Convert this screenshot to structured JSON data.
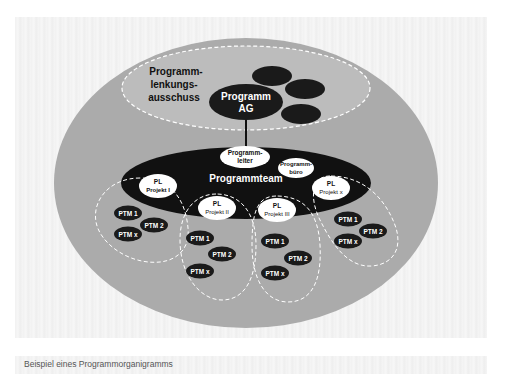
{
  "diagram": {
    "steering_committee": {
      "label_lines": [
        "Programm-",
        "lenkungs-",
        "ausschuss"
      ],
      "ag_lines": [
        "Programm",
        "AG"
      ]
    },
    "program_team": {
      "label": "Programmteam",
      "leader_lines": [
        "Programm-",
        "leiter"
      ],
      "office_lines": [
        "Programm-",
        "büro"
      ]
    },
    "projects": [
      {
        "pl_lines": [
          "PL",
          "Projekt I"
        ],
        "members": [
          "PTM 1",
          "PTM 2",
          "PTM x"
        ]
      },
      {
        "pl_lines": [
          "PL",
          "Projekt II"
        ],
        "members": [
          "PTM 1",
          "PTM 2",
          "PTM x"
        ]
      },
      {
        "pl_lines": [
          "PL",
          "Projekt III"
        ],
        "members": [
          "PTM 1",
          "PTM 2",
          "PTM x"
        ]
      },
      {
        "pl_lines": [
          "PL",
          "Projekt x"
        ],
        "members": [
          "PTM 1",
          "PTM 2",
          "PTM x"
        ]
      }
    ],
    "colors": {
      "outer_circle": "#a9a9a9",
      "dark_node": "#1a1a1a",
      "light_node": "#ffffff",
      "dashed_line": "#ffffff"
    }
  },
  "caption": "Beispiel eines Programmorganigramms"
}
